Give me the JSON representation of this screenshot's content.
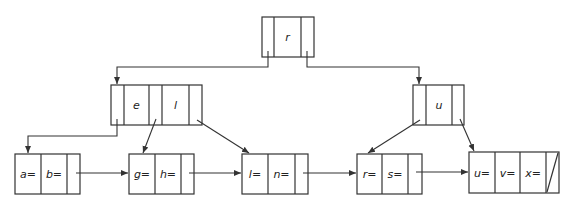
{
  "diagram": {
    "type": "B+ tree",
    "root": {
      "keys": [
        "r"
      ]
    },
    "internal": [
      {
        "keys": [
          "e",
          "l"
        ]
      },
      {
        "keys": [
          "u"
        ]
      }
    ],
    "leaves": [
      {
        "keys": [
          "a=",
          "b="
        ]
      },
      {
        "keys": [
          "g=",
          "h="
        ]
      },
      {
        "keys": [
          "l=",
          "n="
        ]
      },
      {
        "keys": [
          "r=",
          "s="
        ]
      },
      {
        "keys": [
          "u=",
          "v=",
          "x="
        ]
      }
    ],
    "last_leaf_next": "null-pointer"
  }
}
